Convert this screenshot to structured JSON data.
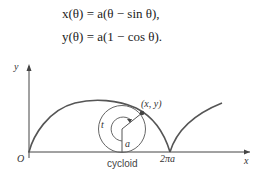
{
  "equations": {
    "x": "x(θ) = a(θ − sin θ),",
    "y": "y(θ) = a(1 − cos θ)."
  },
  "figure": {
    "caption": "cycloid",
    "axis_x_label": "x",
    "axis_y_label": "y",
    "origin_label": "O",
    "period_label": "2πa",
    "point_label": "(x, y)",
    "angle_label": "t",
    "radius_label": "a"
  }
}
